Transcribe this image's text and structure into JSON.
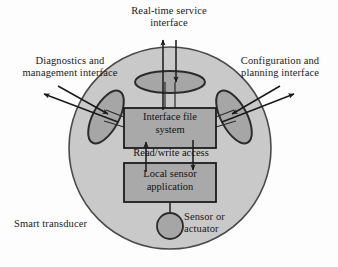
{
  "figure": {
    "title_internal": "Smart transducer interface diagram",
    "type": "block-diagram"
  },
  "labels": {
    "realtime_interface": "Real-time service\ninterface",
    "diagnostics_interface": "Diagnostics and\nmanagement interface",
    "configuration_interface": "Configuration and\nplanning interface",
    "interface_file_system": "Interface file\nsystem",
    "read_write_access": "Read/write access",
    "local_sensor_application": "Local sensor\napplication",
    "smart_transducer": "Smart transducer",
    "sensor_or_actuator": "Sensor or\nactuator"
  },
  "colors": {
    "page_background": "#fdfdfd",
    "transducer_circle_fill": "#c9c9c9",
    "transducer_circle_stroke": "#4a4a4a",
    "ellipse_fill": "#a6a6a6",
    "ellipse_stroke": "#2b2b2b",
    "box_fill": "#a9a9a9",
    "box_stroke": "#1c1c1c",
    "sensor_circle_fill": "#a6a6a6",
    "sensor_circle_stroke": "#2b2b2b",
    "arrow_color": "#1a1a1a",
    "text_color": "#1a1a1a"
  },
  "shapes": {
    "transducer_circle": {
      "cx": 170,
      "cy": 148,
      "r": 101
    },
    "top_ellipse": {
      "cx": 170,
      "cy": 82,
      "rx": 35,
      "ry": 11,
      "rotation": 0
    },
    "left_ellipse": {
      "cx": 106,
      "cy": 117,
      "rx": 13,
      "ry": 29,
      "rotation": 28
    },
    "right_ellipse": {
      "cx": 234,
      "cy": 117,
      "rx": 13,
      "ry": 29,
      "rotation": -28
    },
    "interface_file_system_box": {
      "x": 124,
      "y": 108,
      "w": 92,
      "h": 40
    },
    "local_sensor_box": {
      "x": 124,
      "y": 163,
      "w": 92,
      "h": 39
    },
    "sensor_circle": {
      "cx": 170,
      "cy": 226,
      "r": 13
    }
  },
  "connections": [
    {
      "name": "realtime-up-arrow",
      "from": "interface-file-system",
      "to": "real-time-service-interface",
      "direction": "up"
    },
    {
      "name": "realtime-down-arrow",
      "from": "real-time-service-interface",
      "to": "interface-file-system",
      "direction": "down"
    },
    {
      "name": "diagnostics-out-arrow",
      "from": "interface-file-system",
      "to": "diagnostics-and-management-interface",
      "direction": "up-left"
    },
    {
      "name": "diagnostics-in-arrow",
      "from": "diagnostics-and-management-interface",
      "to": "interface-file-system",
      "direction": "down-right"
    },
    {
      "name": "configuration-out-arrow",
      "from": "interface-file-system",
      "to": "configuration-and-planning-interface",
      "direction": "up-right"
    },
    {
      "name": "configuration-in-arrow",
      "from": "configuration-and-planning-interface",
      "to": "interface-file-system",
      "direction": "down-left"
    },
    {
      "name": "read-arrow",
      "from": "local-sensor-application",
      "to": "interface-file-system",
      "direction": "up"
    },
    {
      "name": "write-arrow",
      "from": "interface-file-system",
      "to": "local-sensor-application",
      "direction": "down"
    },
    {
      "name": "sensor-link",
      "from": "local-sensor-application",
      "to": "sensor-or-actuator",
      "direction": "none"
    }
  ]
}
